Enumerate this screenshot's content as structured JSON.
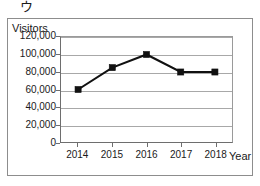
{
  "panel": {
    "label": "ウ"
  },
  "axis": {
    "y_title": "Visitors",
    "x_title": "Year"
  },
  "chart_data": {
    "type": "line",
    "title": "",
    "subtitle": "",
    "xlabel": "Year",
    "ylabel": "Visitors",
    "categories": [
      "2014",
      "2015",
      "2016",
      "2017",
      "2018"
    ],
    "values": [
      60000,
      85000,
      100000,
      80000,
      80000
    ],
    "series": [
      {
        "name": "Visitors",
        "values": [
          60000,
          85000,
          100000,
          80000,
          80000
        ],
        "marker": "square",
        "color": "#111111"
      }
    ],
    "ylim": [
      0,
      120000
    ],
    "ytick_labels": [
      "0",
      "20,000",
      "40,000",
      "60,000",
      "80,000",
      "100,000",
      "120,000"
    ],
    "ytick_values": [
      0,
      20000,
      40000,
      60000,
      80000,
      100000,
      120000
    ],
    "xtick_labels": [
      "2014",
      "2015",
      "2016",
      "2017",
      "2018"
    ],
    "grid": "horizontal",
    "legend": "none",
    "grid_color": "#a8a8a8",
    "axis_color": "#6e6e6e"
  }
}
